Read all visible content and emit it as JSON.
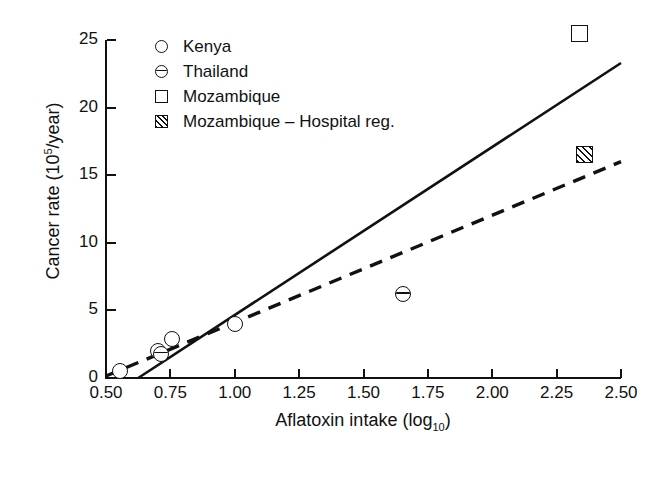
{
  "chart_data": {
    "type": "scatter",
    "title": "",
    "xlabel": "Aflatoxin intake (log10)",
    "ylabel": "Cancer rate (10^5/year)",
    "xlim": [
      0.5,
      2.5
    ],
    "ylim": [
      0,
      25
    ],
    "grid": false,
    "legend_position": "top-left-inside",
    "x_ticks": [
      "0.50",
      "0.75",
      "1.00",
      "1.25",
      "1.50",
      "1.75",
      "2.00",
      "2.25",
      "2.50"
    ],
    "x_tick_values": [
      0.5,
      0.75,
      1.0,
      1.25,
      1.5,
      1.75,
      2.0,
      2.25,
      2.5
    ],
    "y_ticks": [
      "0",
      "5",
      "10",
      "15",
      "20",
      "25"
    ],
    "y_tick_values": [
      0,
      5,
      10,
      15,
      20,
      25
    ],
    "series": [
      {
        "name": "Kenya",
        "marker": "open-circle",
        "points": [
          {
            "x": 0.555,
            "y": 0.5
          },
          {
            "x": 0.7,
            "y": 2.0
          },
          {
            "x": 0.755,
            "y": 2.9
          },
          {
            "x": 1.0,
            "y": 4.0
          }
        ]
      },
      {
        "name": "Thailand",
        "marker": "circle-with-horizontal-bar",
        "points": [
          {
            "x": 0.715,
            "y": 1.8
          },
          {
            "x": 1.655,
            "y": 6.2
          }
        ]
      },
      {
        "name": "Mozambique",
        "marker": "open-square",
        "points": [
          {
            "x": 2.34,
            "y": 25.5
          }
        ]
      },
      {
        "name": "Mozambique - Hospital reg.",
        "marker": "hatched-square",
        "points": [
          {
            "x": 2.36,
            "y": 16.5
          }
        ]
      }
    ],
    "fit_lines": [
      {
        "name": "solid-regression-line",
        "style": "solid",
        "x_start": 0.625,
        "y_start": 0.0,
        "x_end": 2.5,
        "y_end": 23.3
      },
      {
        "name": "dashed-regression-line",
        "style": "dashed",
        "x_start": 0.5,
        "y_start": 0.15,
        "x_end": 2.5,
        "y_end": 16.0
      }
    ]
  },
  "axes": {
    "y_title_main": "Cancer rate (10",
    "y_title_sup": "5",
    "y_title_tail": "/year)",
    "x_title_main": "Aflatoxin intake (log",
    "x_title_sub": "10",
    "x_title_tail": ")",
    "y_tick_labels": [
      "25",
      "20",
      "15",
      "10",
      "5",
      "0"
    ],
    "x_tick_labels": [
      "0.50",
      "0.75",
      "1.00",
      "1.25",
      "1.50",
      "1.75",
      "2.00",
      "2.25",
      "2.50"
    ]
  },
  "legend": {
    "items": [
      {
        "label": "Kenya",
        "marker": "open-circle"
      },
      {
        "label": "Thailand",
        "marker": "circle-with-horizontal-bar"
      },
      {
        "label": "Mozambique",
        "marker": "open-square"
      },
      {
        "label": "Mozambique – Hospital reg.",
        "marker": "hatched-square"
      }
    ]
  },
  "colors": {
    "ink": "#111111",
    "background": "#ffffff"
  }
}
